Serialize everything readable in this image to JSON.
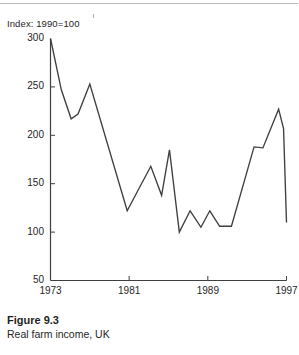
{
  "figure": {
    "number_label": "Figure 9.3",
    "caption": "Real farm income, UK"
  },
  "chart_data": {
    "type": "line",
    "title": "",
    "subtitle": "",
    "axis_note": "Index: 1990=100",
    "xlabel": "",
    "ylabel": "",
    "xlim": [
      1973,
      1997
    ],
    "ylim": [
      50,
      300
    ],
    "ytick_labels": [
      "300",
      "250",
      "200",
      "150",
      "100",
      "50"
    ],
    "yticks": [
      300,
      250,
      200,
      150,
      100,
      50
    ],
    "xtick_labels": [
      "1973",
      "1981",
      "1989",
      "1997"
    ],
    "xticks": [
      1973,
      1981,
      1989,
      1997
    ],
    "grid": false,
    "legend": "none",
    "line_color": "#3f3f3f",
    "x": [
      1973,
      1974,
      1975,
      1976,
      1977,
      1978,
      1979,
      1980,
      1981,
      1982,
      1983,
      1984,
      1985,
      1986,
      1987,
      1988,
      1989,
      1990,
      1991,
      1992,
      1993,
      1994,
      1995,
      1996,
      1997
    ],
    "values": [
      300,
      247,
      217,
      222,
      253,
      230,
      200,
      160,
      122,
      145,
      168,
      138,
      185,
      100,
      112,
      122,
      105,
      122,
      106,
      106,
      148,
      188,
      187,
      227,
      207
    ],
    "series": [
      {
        "name": "Real farm income, UK",
        "points": [
          {
            "x": 1973,
            "y": 300
          },
          {
            "x": 1974.1,
            "y": 247
          },
          {
            "x": 1975.1,
            "y": 217
          },
          {
            "x": 1975.8,
            "y": 222
          },
          {
            "x": 1977.0,
            "y": 253
          },
          {
            "x": 1980.8,
            "y": 122
          },
          {
            "x": 1982.0,
            "y": 145
          },
          {
            "x": 1983.2,
            "y": 168
          },
          {
            "x": 1984.3,
            "y": 138
          },
          {
            "x": 1985.1,
            "y": 185
          },
          {
            "x": 1986.1,
            "y": 100
          },
          {
            "x": 1987.2,
            "y": 122
          },
          {
            "x": 1988.3,
            "y": 105
          },
          {
            "x": 1989.2,
            "y": 122
          },
          {
            "x": 1990.2,
            "y": 106
          },
          {
            "x": 1991.4,
            "y": 106
          },
          {
            "x": 1993.7,
            "y": 188
          },
          {
            "x": 1994.6,
            "y": 187
          },
          {
            "x": 1996.2,
            "y": 227
          },
          {
            "x": 1996.7,
            "y": 207
          },
          {
            "x": 1997.0,
            "y": 110
          }
        ]
      }
    ]
  }
}
